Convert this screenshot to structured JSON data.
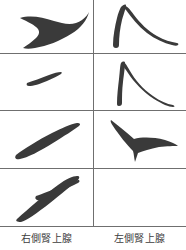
{
  "figure": {
    "type": "anatomy-silhouette-grid",
    "background_color": "#ffffff",
    "stroke_color": "#3a3a3a",
    "rule_color": "#6f6f6f",
    "columns": 2,
    "rows": 4,
    "width": 186,
    "height": 250
  },
  "columns": [
    {
      "id": "right-adrenal",
      "label": "右側腎上腺"
    },
    {
      "id": "left-adrenal",
      "label": "左側腎上腺"
    }
  ],
  "rules": {
    "horizontal_y": [
      53,
      110,
      168,
      226
    ],
    "vertical_x": 93,
    "vertical_top": 0,
    "vertical_bottom": 226
  },
  "cells": [
    {
      "row": 1,
      "column": "right-adrenal",
      "shape_name": "crescent-boomerang-silhouette",
      "empty": false
    },
    {
      "row": 1,
      "column": "left-adrenal",
      "shape_name": "inverted-v-lambda-silhouette",
      "empty": false
    },
    {
      "row": 2,
      "column": "right-adrenal",
      "shape_name": "short-sliver-silhouette",
      "empty": false
    },
    {
      "row": 2,
      "column": "left-adrenal",
      "shape_name": "narrow-lambda-long-tail-silhouette",
      "empty": false
    },
    {
      "row": 3,
      "column": "right-adrenal",
      "shape_name": "long-diagonal-sliver-silhouette",
      "empty": false
    },
    {
      "row": 3,
      "column": "left-adrenal",
      "shape_name": "three-point-star-silhouette",
      "empty": false
    },
    {
      "row": 4,
      "column": "right-adrenal",
      "shape_name": "arrowhead-up-right-silhouette",
      "empty": false
    },
    {
      "row": 4,
      "column": "left-adrenal",
      "shape_name": "blank",
      "empty": true
    }
  ]
}
